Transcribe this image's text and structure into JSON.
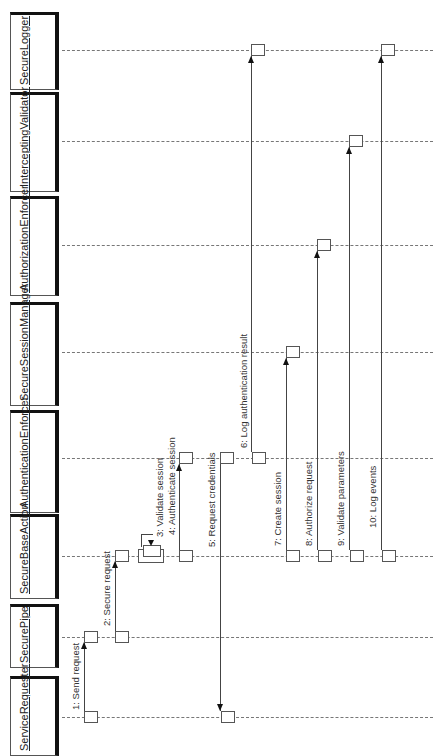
{
  "diagram": {
    "type": "sequence",
    "orientation": "rotated-90-ccw",
    "participants": [
      {
        "name": "SecureLogger"
      },
      {
        "name": "InterceptingValidator"
      },
      {
        "name": "AuthorizationEnforcer"
      },
      {
        "name": "SecureSessionManager"
      },
      {
        "name": "AuthenticationEnforcer"
      },
      {
        "name": "SecureBaseAction"
      },
      {
        "name": "SecurePipe"
      },
      {
        "name": "ServiceRequester"
      }
    ],
    "messages": [
      {
        "label": "1: Send request",
        "from": "ServiceRequester",
        "to": "SecurePipe"
      },
      {
        "label": "2: Secure request",
        "from": "SecurePipe",
        "to": "SecureBaseAction"
      },
      {
        "label": "3: Validate session",
        "from": "SecureBaseAction",
        "to": "SecureBaseAction"
      },
      {
        "label": "4: Authenticate session",
        "from": "SecureBaseAction",
        "to": "AuthenticationEnforcer"
      },
      {
        "label": "5: Request credentials",
        "from": "AuthenticationEnforcer",
        "to": "ServiceRequester"
      },
      {
        "label": "6: Log authentication result",
        "from": "AuthenticationEnforcer",
        "to": "SecureLogger"
      },
      {
        "label": "7: Create session",
        "from": "SecureBaseAction",
        "to": "SecureSessionManager"
      },
      {
        "label": "8: Authorize request",
        "from": "SecureBaseAction",
        "to": "AuthorizationEnforcer"
      },
      {
        "label": "9: Validate parameters",
        "from": "SecureBaseAction",
        "to": "InterceptingValidator"
      },
      {
        "label": "10: Log events",
        "from": "SecureBaseAction",
        "to": "SecureLogger"
      }
    ]
  }
}
